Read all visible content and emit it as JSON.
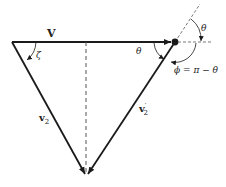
{
  "diagram": {
    "title": "",
    "labels": {
      "V": "V",
      "zeta": "ζ",
      "theta_left": "θ",
      "theta_right": "θ",
      "phi_eq": "ϕ = π − θ",
      "v2": "v",
      "v2_sub": "2",
      "v2p": "v",
      "v2p_sup": "′",
      "v2p_sub": "2"
    },
    "colors": {
      "line": "#1a1a1a",
      "dashed": "#555555",
      "background": "#ffffff"
    }
  }
}
